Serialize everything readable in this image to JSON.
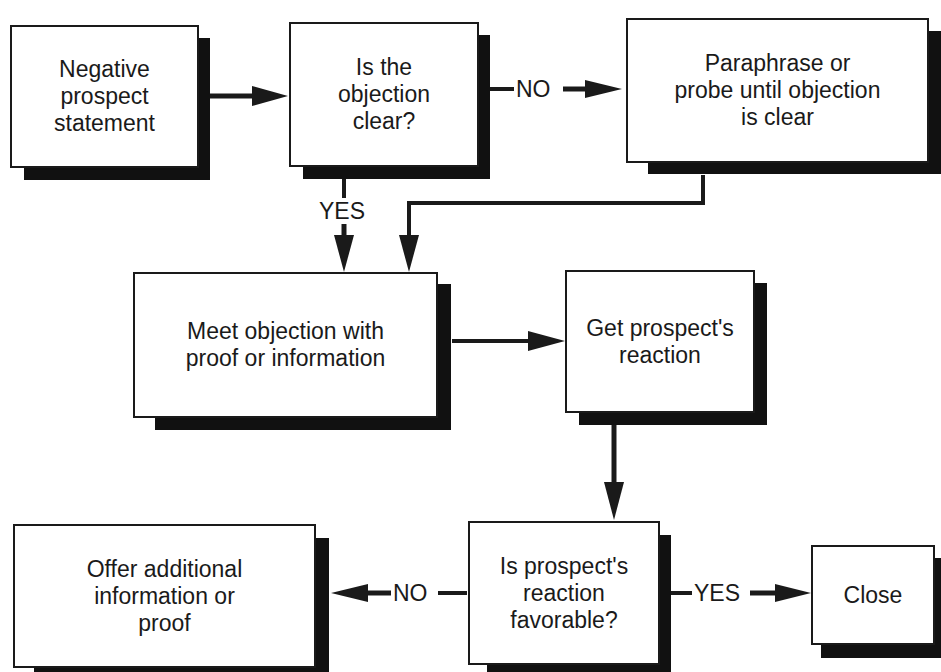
{
  "diagram": {
    "type": "flowchart",
    "title_cutoff": "Figure: Handling objections",
    "nodes": {
      "negative_statement": {
        "label": "Negative\nprospect\nstatement"
      },
      "objection_clear": {
        "label": "Is the\nobjection\nclear?"
      },
      "paraphrase": {
        "label": "Paraphrase or\nprobe until objection\nis clear"
      },
      "meet_objection": {
        "label": "Meet objection with\nproof or information"
      },
      "get_reaction": {
        "label": "Get prospect's\nreaction"
      },
      "reaction_favorable": {
        "label": "Is prospect's\nreaction\nfavorable?"
      },
      "offer_info": {
        "label": "Offer additional\ninformation or\nproof"
      },
      "close": {
        "label": "Close"
      }
    },
    "edges": {
      "clear_no": {
        "from": "objection_clear",
        "to": "paraphrase",
        "label": "NO"
      },
      "clear_yes": {
        "from": "objection_clear",
        "to": "meet_objection",
        "label": "YES"
      },
      "favorable_no": {
        "from": "reaction_favorable",
        "to": "offer_info",
        "label": "NO"
      },
      "favorable_yes": {
        "from": "reaction_favorable",
        "to": "close",
        "label": "YES"
      }
    },
    "colors": {
      "stroke": "#1a1a1a",
      "shadow": "#111111",
      "fill": "#ffffff"
    }
  }
}
